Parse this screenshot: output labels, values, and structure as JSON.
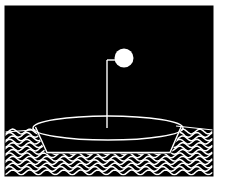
{
  "artwork": {
    "title": "Boat on Waves with Moon",
    "medium": "high-contrast black and white illustration",
    "canvas": {
      "width": 228,
      "height": 190,
      "background_color": "#ffffff"
    },
    "frame": {
      "label": "black rectangular picture field",
      "x": 5,
      "y": 6,
      "width": 208,
      "height": 170,
      "fill_color": "#000000",
      "border_color": "#000000"
    },
    "ink_color": "#ffffff",
    "elements": {
      "moon": {
        "label": "Moon",
        "shape": "filled circle",
        "center_x": 124,
        "center_y": 58,
        "radius": 9.5,
        "fill_color": "#ffffff"
      },
      "mast": {
        "label": "Mast",
        "shape": "vertical line",
        "x": 107,
        "top_y": 60,
        "bottom_y": 129,
        "stroke_color": "#ffffff",
        "stroke_width": 1.4
      },
      "yard": {
        "label": "Masthead crossbar",
        "shape": "short horizontal line",
        "y": 60,
        "x_start": 107,
        "x_end": 116,
        "stroke_color": "#ffffff",
        "stroke_width": 1.4
      },
      "boat_rim": {
        "label": "Boat rim ellipse",
        "shape": "ellipse outline",
        "center_x": 108,
        "center_y": 128,
        "radius_x": 75,
        "radius_y": 12,
        "stroke_color": "#ffffff",
        "stroke_width": 1.3
      },
      "hull": {
        "label": "Boat hull",
        "shape": "tapered trapezoid outline below rim",
        "left_top_x": 35,
        "right_top_x": 181,
        "left_bottom_x": 47,
        "right_bottom_x": 170,
        "top_y": 129,
        "bottom_y": 152,
        "stroke_color": "#ffffff",
        "stroke_width": 1.3
      },
      "horizon": {
        "label": "Horizon line",
        "shape": "near-horizontal line across water edges",
        "left_y": 131,
        "right_y": 128,
        "stroke_color": "#ffffff",
        "stroke_width": 1.2
      },
      "water": {
        "label": "Wavy water",
        "shape": "stack of sinusoidal horizontal lines",
        "top_y": 129,
        "bottom_y": 175,
        "line_count": 14,
        "line_spacing": 3.4,
        "wave_amplitude": 2.4,
        "wave_wavelength": 17,
        "stroke_color": "#ffffff",
        "stroke_width": 1.5
      }
    },
    "caption": ""
  }
}
